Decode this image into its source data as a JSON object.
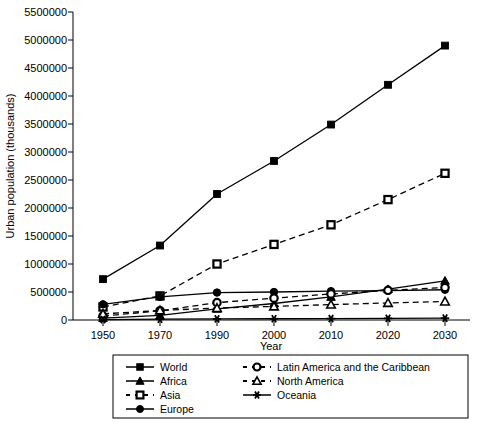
{
  "chart_data": {
    "type": "line",
    "title": "",
    "xlabel": "Year",
    "ylabel": "Urban population (thousands)",
    "categories": [
      "1950",
      "1970",
      "1990",
      "2000",
      "2010",
      "2020",
      "2030"
    ],
    "ylim": [
      0,
      5500000
    ],
    "ytick_values": [
      0,
      500000,
      1000000,
      1500000,
      2000000,
      2500000,
      3000000,
      3500000,
      4000000,
      4500000,
      5000000,
      5500000
    ],
    "ytick_labels": [
      "0",
      "500000",
      "1000000",
      "1500000",
      "2000000",
      "2500000",
      "3000000",
      "3500000",
      "4000000",
      "4500000",
      "5000000",
      "5500000"
    ],
    "grid": false,
    "legend_position": "bottom",
    "series": [
      {
        "name": "World",
        "marker": "filled-square",
        "linestyle": "solid",
        "values": [
          730000,
          1330000,
          2250000,
          2840000,
          3490000,
          4200000,
          4900000
        ]
      },
      {
        "name": "Africa",
        "marker": "filled-triangle",
        "linestyle": "solid",
        "values": [
          33000,
          83000,
          200000,
          295000,
          412000,
          550000,
          700000
        ]
      },
      {
        "name": "Asia",
        "marker": "open-square",
        "linestyle": "dashed",
        "values": [
          232000,
          430000,
          1000000,
          1350000,
          1700000,
          2150000,
          2620000
        ]
      },
      {
        "name": "Europe",
        "marker": "filled-circle",
        "linestyle": "solid",
        "values": [
          280000,
          412000,
          490000,
          500000,
          515000,
          525000,
          540000
        ]
      },
      {
        "name": "Latin America and the Caribbean",
        "marker": "open-circle",
        "linestyle": "dashed",
        "values": [
          70000,
          165000,
          310000,
          390000,
          465000,
          530000,
          580000
        ]
      },
      {
        "name": "North America",
        "marker": "open-triangle",
        "linestyle": "dashed",
        "values": [
          110000,
          170000,
          213000,
          243000,
          275000,
          305000,
          330000
        ]
      },
      {
        "name": "Oceania",
        "marker": "asterisk",
        "linestyle": "solid",
        "values": [
          8000,
          14000,
          19000,
          22000,
          25000,
          29000,
          32000
        ]
      }
    ]
  },
  "legend": {
    "column_left": [
      "World",
      "Africa",
      "Asia",
      "Europe"
    ],
    "column_right": [
      "Latin America and the Caribbean",
      "North America",
      "Oceania"
    ]
  },
  "axes": {
    "x_title": "Year",
    "y_title": "Urban population (thousands)"
  }
}
